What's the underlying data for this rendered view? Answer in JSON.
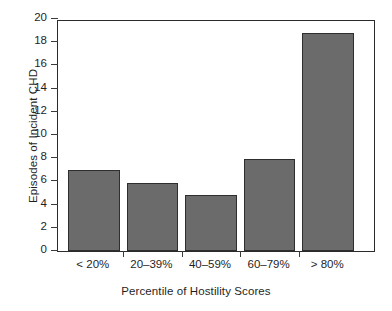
{
  "chart_data": {
    "type": "bar",
    "title": "",
    "xlabel": "Percentile of Hostility Scores",
    "ylabel": "Episodes of Incident CHD",
    "categories": [
      "< 20%",
      "20–39%",
      "40–59%",
      "60–79%",
      "> 80%"
    ],
    "values": [
      7.0,
      5.9,
      4.85,
      7.9,
      18.8
    ],
    "ylim": [
      0,
      20
    ],
    "yticks": [
      0,
      2,
      4,
      6,
      8,
      10,
      12,
      14,
      16,
      18,
      20
    ],
    "ytick_labels": [
      "0",
      "2",
      "4",
      "6",
      "8",
      "10",
      "12",
      "14",
      "16",
      "18",
      "20"
    ],
    "grid": false,
    "legend": false,
    "bar_color": "#6b6b6b",
    "bar_edge_color": "#2e2e2e",
    "axis_color": "#2b2b2b",
    "background": "#ffffff"
  },
  "axes": {
    "y_title": "Episodes of Incident CHD",
    "x_title": "Percentile of Hostility Scores"
  }
}
